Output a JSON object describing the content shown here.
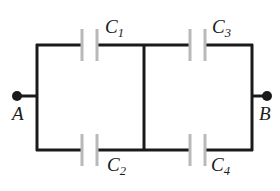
{
  "figure": {
    "name": "capacitor-network-diagram",
    "type": "electrical-circuit-schematic",
    "background_color": "#ffffff",
    "wire_color": "#1a1a1a",
    "plate_color": "#b9b9b9",
    "label_color": "#1b1b1b"
  },
  "terminals": [
    {
      "id": "A",
      "label": "A",
      "side": "left",
      "dot_x": 17,
      "dot_y": 96
    },
    {
      "id": "B",
      "label": "B",
      "side": "right",
      "dot_x": 267,
      "dot_y": 96
    }
  ],
  "capacitors": [
    {
      "id": "C1",
      "label": "C",
      "subscript": "1",
      "branch": "top",
      "position": "left",
      "label_x": 105,
      "label_y": 17
    },
    {
      "id": "C3",
      "label": "C",
      "subscript": "3",
      "branch": "top",
      "position": "right",
      "label_x": 212,
      "label_y": 17
    },
    {
      "id": "C2",
      "label": "C",
      "subscript": "2",
      "branch": "bottom",
      "position": "left",
      "label_x": 107,
      "label_y": 155
    },
    {
      "id": "C4",
      "label": "C",
      "subscript": "4",
      "branch": "bottom",
      "position": "right",
      "label_x": 211,
      "label_y": 155
    }
  ],
  "geometry": {
    "left_rail_x": 36,
    "middle_rail_x": 144,
    "right_rail_x": 252,
    "top_rail_y": 45,
    "bottom_rail_y": 150,
    "plate_half_height": 16,
    "plate_gap": 15,
    "wire_width": 3,
    "plate_width": 3,
    "terminal_dot_radius": 5,
    "cap_plate_x": {
      "c1_left": 82,
      "c1_right": 97,
      "c2_left": 82,
      "c2_right": 97,
      "c3_left": 190,
      "c3_right": 205,
      "c4_left": 190,
      "c4_right": 205
    }
  }
}
